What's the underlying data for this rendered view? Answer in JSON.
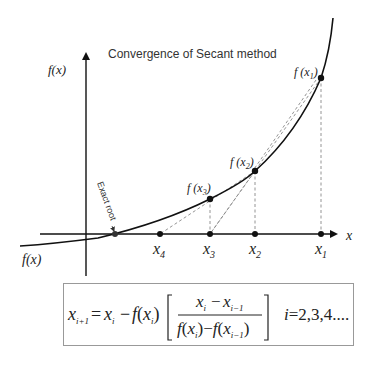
{
  "diagram": {
    "title": "Convergence of Secant method",
    "y_axis_label": "f(x)",
    "x_axis_label": "x",
    "curve_label": "f(x)",
    "annotation": "Exact root",
    "points": [
      {
        "label": "f(x1)",
        "x_label": "x1"
      },
      {
        "label": "f(x2)",
        "x_label": "x2"
      },
      {
        "label": "f(x3)",
        "x_label": "x3"
      },
      {
        "label": "",
        "x_label": "x4"
      }
    ],
    "formula": {
      "lhs": "x_{i+1} = x_i − f(x_i) [ (x_i − x_{i−1}) / (f(x_i) − f(x_{i−1})) ]",
      "index_note": "i = 2,3,4...."
    },
    "colors": {
      "curve": "#111111",
      "axes": "#111111",
      "dashed": "#888888",
      "box_border": "#999999"
    }
  }
}
